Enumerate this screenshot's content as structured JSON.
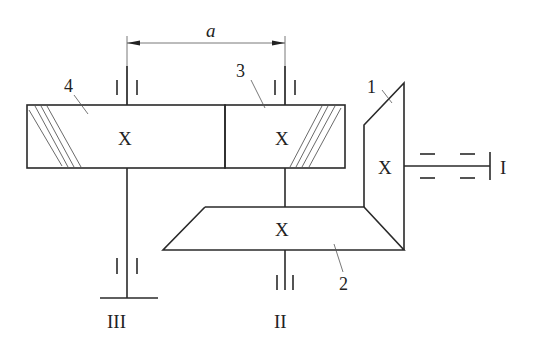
{
  "diagram": {
    "type": "gear-train-kinematic-schematic",
    "dimension": {
      "label": "a"
    },
    "gears": [
      {
        "id": "1",
        "label": "1",
        "kind": "bevel",
        "center_mark": "X"
      },
      {
        "id": "2",
        "label": "2",
        "kind": "bevel",
        "center_mark": "X"
      },
      {
        "id": "3",
        "label": "3",
        "kind": "helical-cylindrical",
        "center_mark": "X"
      },
      {
        "id": "4",
        "label": "4",
        "kind": "helical-cylindrical",
        "center_mark": "X"
      }
    ],
    "shafts": [
      {
        "id": "I",
        "label": "I"
      },
      {
        "id": "II",
        "label": "II"
      },
      {
        "id": "III",
        "label": "III"
      }
    ]
  }
}
